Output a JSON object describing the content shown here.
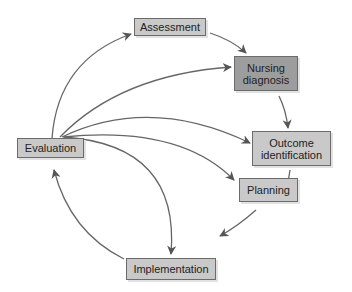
{
  "diagram": {
    "title": "",
    "type": "cycle",
    "colors": {
      "node_fill": "#c9c9c9",
      "highlight_fill": "#9d9d9d",
      "border": "#6b6b6b",
      "arrow": "#555555"
    },
    "nodes": [
      {
        "id": "assessment",
        "line1": "Assessment",
        "line2": ""
      },
      {
        "id": "nursing-diagnosis",
        "line1": "Nursing",
        "line2": "diagnosis"
      },
      {
        "id": "outcome-identification",
        "line1": "Outcome",
        "line2": "identification"
      },
      {
        "id": "planning",
        "line1": "Planning",
        "line2": ""
      },
      {
        "id": "implementation",
        "line1": "Implementation",
        "line2": ""
      },
      {
        "id": "evaluation",
        "line1": "Evaluation",
        "line2": ""
      }
    ],
    "edges": [
      {
        "from": "assessment",
        "to": "nursing-diagnosis"
      },
      {
        "from": "nursing-diagnosis",
        "to": "outcome-identification"
      },
      {
        "from": "outcome-identification",
        "to": "planning"
      },
      {
        "from": "planning",
        "to": "implementation"
      },
      {
        "from": "implementation",
        "to": "evaluation"
      },
      {
        "from": "evaluation",
        "to": "assessment"
      },
      {
        "from": "evaluation",
        "to": "nursing-diagnosis"
      },
      {
        "from": "evaluation",
        "to": "outcome-identification"
      },
      {
        "from": "evaluation",
        "to": "planning"
      },
      {
        "from": "evaluation",
        "to": "implementation"
      }
    ]
  }
}
